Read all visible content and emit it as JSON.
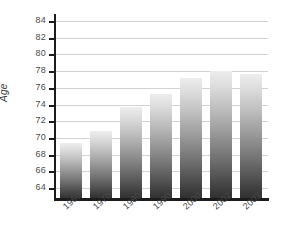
{
  "chart_data": {
    "type": "bar",
    "title": "",
    "subtitle": "",
    "xlabel": "",
    "ylabel": "Age",
    "categories": [
      "1960",
      "1970",
      "1980",
      "1990",
      "2000",
      "2002",
      "2003"
    ],
    "values": [
      69.4,
      70.8,
      73.7,
      75.2,
      77.2,
      78.0,
      77.6
    ],
    "series": [
      {
        "name": "Age",
        "values": [
          69.4,
          70.8,
          73.7,
          75.2,
          77.2,
          78.0,
          77.6
        ]
      }
    ],
    "ylim": [
      63.0,
      84.5
    ],
    "y_ticks": [
      64,
      66,
      68,
      70,
      72,
      74,
      76,
      78,
      80,
      82,
      84
    ],
    "y_tick_labels": [
      "64",
      "66",
      "68",
      "70",
      "72",
      "74",
      "76",
      "78",
      "80",
      "82",
      "84"
    ],
    "grid": true,
    "grid_axis": "y",
    "legend": false,
    "legend_position": "none",
    "bar_fill": "vertical-gradient-light-to-dark",
    "bar_color_top": "#ededed",
    "bar_color_bottom": "#2f2f2f",
    "axis_color": "#1c1c1c",
    "gridline_color": "#d2d2d2",
    "tick_label_color": "#4a4a4a",
    "background": "#ffffff",
    "annotations": []
  }
}
